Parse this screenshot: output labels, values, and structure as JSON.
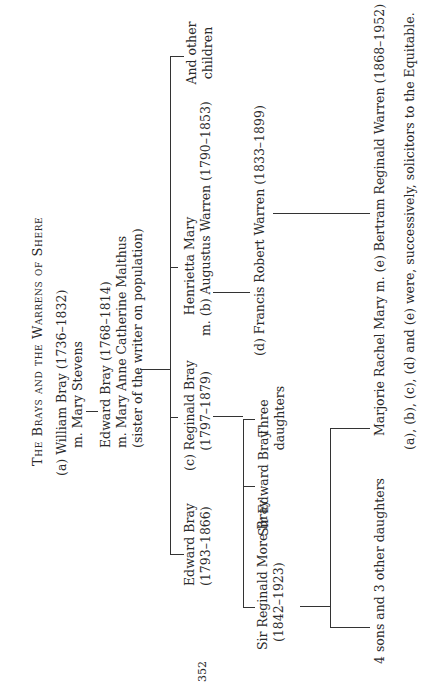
{
  "title": "The Brays and the Warrens of Shere",
  "page_number": "352",
  "tree": {
    "william": {
      "label": "(a)  William Bray (1736–1832)",
      "spouse": "m. Mary Stevens"
    },
    "edward_senior": {
      "name": "Edward Bray (1768–1814)",
      "spouse": "m. Mary Anne Catherine Malthus",
      "note": "(sister of the writer on population)"
    },
    "children": {
      "edward": {
        "name": "Edward Bray",
        "dates": "(1793–1866)"
      },
      "reginald": {
        "name": "(c)  Reginald Bray",
        "dates": "(1797–1879)"
      },
      "henrietta": {
        "name": "Henrietta Mary",
        "spouse": "m. (b) Augustus Warren (1790–1853)"
      },
      "others": {
        "line1": "And other",
        "line2": "children"
      }
    },
    "reginald_children": {
      "sir_reginald": {
        "name": "Sir Reginald More Bray",
        "dates": "(1842–1923)"
      },
      "sir_edward": {
        "name": "Sir Edward Bray"
      },
      "daughters": {
        "line1": "Three",
        "line2": "daughters"
      }
    },
    "francis": {
      "name": "(d)  Francis Robert Warren (1833–1899)"
    },
    "grandchildren": {
      "four_sons": {
        "name": "4 sons and 3 other daughters"
      },
      "marjorie": {
        "name": "Marjorie Rachel Mary m. (e) Bertram Reginald Warren (1868–1952)"
      }
    }
  },
  "footnote": "(a), (b), (c), (d) and (e) were, successively, solicitors to the Equitable."
}
